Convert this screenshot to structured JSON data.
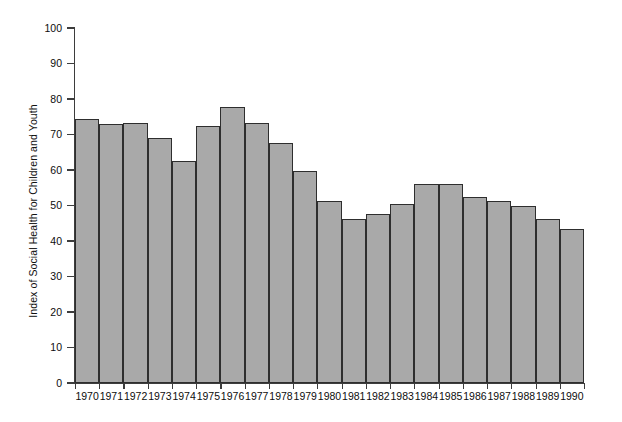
{
  "chart_data": {
    "type": "bar",
    "title": "",
    "subtitle": "",
    "xlabel": "",
    "ylabel": "Index of Social Health for Children and Youth",
    "ylim": [
      0,
      100
    ],
    "ytick_step": 10,
    "yticks": [
      0,
      10,
      20,
      30,
      40,
      50,
      60,
      70,
      80,
      90,
      100
    ],
    "grid": false,
    "legend": false,
    "legend_position": "none",
    "bar_fill_color": "#a9a9a9",
    "bar_edge_color": "#2e2e2e",
    "axis_color": "#3d3d3d",
    "background_color": "#ffffff",
    "categories": [
      "1970",
      "1971",
      "1972",
      "1973",
      "1974",
      "1975",
      "1976",
      "1977",
      "1978",
      "1979",
      "1980",
      "1981",
      "1982",
      "1983",
      "1984",
      "1985",
      "1986",
      "1987",
      "1988",
      "1989",
      "1990"
    ],
    "values": [
      74.5,
      73.0,
      73.2,
      69.0,
      62.5,
      72.3,
      77.8,
      73.3,
      67.5,
      59.8,
      51.4,
      46.3,
      47.5,
      50.3,
      56.0,
      56.0,
      52.3,
      51.2,
      50.0,
      46.3,
      43.3
    ],
    "series": [
      {
        "name": "Index of Social Health for Children and Youth",
        "values": [
          74.5,
          73.0,
          73.2,
          69.0,
          62.5,
          72.3,
          77.8,
          73.3,
          67.5,
          59.8,
          51.4,
          46.3,
          47.5,
          50.3,
          56.0,
          56.0,
          52.3,
          51.2,
          50.0,
          46.3,
          43.3
        ]
      }
    ],
    "max_value": 77.8,
    "max_category": "1976",
    "min_value": 43.3,
    "min_category": "1990",
    "annotations": []
  }
}
